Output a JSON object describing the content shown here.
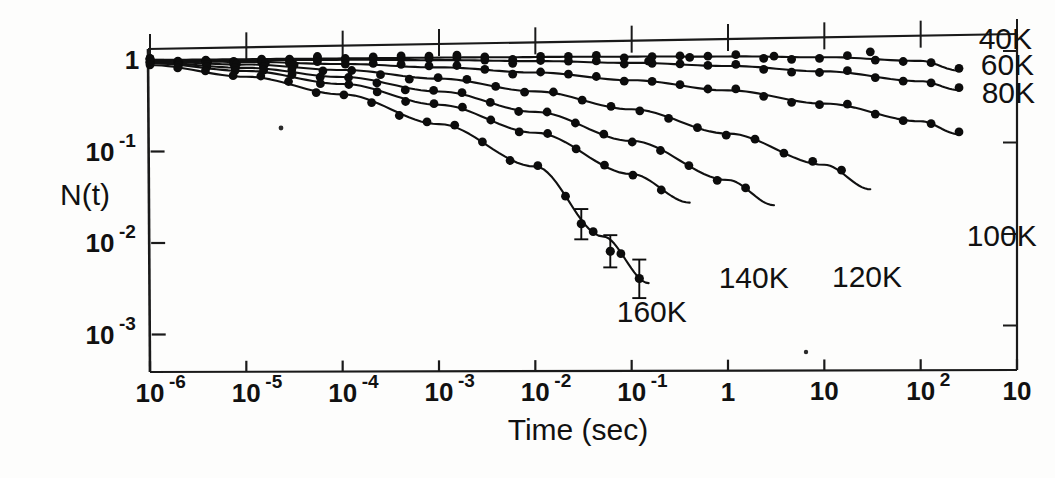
{
  "figure": {
    "background_color": "#fdfdfc",
    "ink_color": "#111111",
    "xlabel": "Time (sec)",
    "ylabel": "N(t)"
  },
  "chart_data": {
    "type": "line",
    "title": "",
    "subtitle": "",
    "xlabel": "Time (sec)",
    "ylabel": "N(t)",
    "xscale": "log",
    "yscale": "log",
    "xlim": [
      1e-06,
      1000
    ],
    "ylim": [
      0.001,
      2
    ],
    "grid": false,
    "legend_position": "inline-right-of-curves",
    "x_tick_labels": [
      "10-6",
      "10-5",
      "10-4",
      "10-3",
      "10-2",
      "10-1",
      "1",
      "10",
      "102",
      "10"
    ],
    "x_tick_mantissas": [
      "10",
      "10",
      "10",
      "10",
      "10",
      "10",
      "1",
      "10",
      "10",
      "10"
    ],
    "x_tick_exponents": [
      "-6",
      "-5",
      "-4",
      "-3",
      "-2",
      "-1",
      "",
      "",
      "2",
      ""
    ],
    "x_tick_values": [
      1e-06,
      1e-05,
      0.0001,
      0.001,
      0.01,
      0.1,
      1,
      10,
      100,
      1000
    ],
    "x_last_tick_clipped": true,
    "y_tick_labels": [
      "1",
      "10-1",
      "10-2",
      "10-3"
    ],
    "y_tick_mantissas": [
      "1",
      "10",
      "10",
      "10"
    ],
    "y_tick_exponents": [
      "",
      "-1",
      "-2",
      "-3"
    ],
    "y_tick_values": [
      1,
      0.1,
      0.01,
      0.001
    ],
    "series": [
      {
        "name": "40K",
        "label": "40K",
        "label_x": 400,
        "label_y": 1.05,
        "x": [
          1e-06,
          1e-05,
          0.0001,
          0.001,
          0.01,
          0.1,
          1,
          10,
          100,
          250
        ],
        "values": [
          1.0,
          0.995,
          0.99,
          0.985,
          0.975,
          0.96,
          0.94,
          0.9,
          0.8,
          0.62
        ]
      },
      {
        "name": "60K",
        "label": "60K",
        "label_x": 420,
        "label_y": 0.55,
        "x": [
          1e-06,
          1e-05,
          0.0001,
          0.001,
          0.01,
          0.1,
          1,
          10,
          100,
          250
        ],
        "values": [
          0.99,
          0.975,
          0.955,
          0.925,
          0.88,
          0.82,
          0.74,
          0.63,
          0.48,
          0.38
        ]
      },
      {
        "name": "80K",
        "label": "80K",
        "label_x": 430,
        "label_y": 0.27,
        "x": [
          1e-06,
          1e-05,
          0.0001,
          0.001,
          0.01,
          0.1,
          1,
          10,
          100,
          250
        ],
        "values": [
          0.975,
          0.93,
          0.86,
          0.77,
          0.66,
          0.53,
          0.4,
          0.28,
          0.175,
          0.125
        ]
      },
      {
        "name": "100K",
        "label": "100K",
        "label_x": 300,
        "label_y": 0.0075,
        "x": [
          1e-06,
          1e-05,
          0.0001,
          0.001,
          0.01,
          0.1,
          1,
          10,
          30
        ],
        "values": [
          0.96,
          0.87,
          0.74,
          0.58,
          0.41,
          0.255,
          0.135,
          0.06,
          0.032
        ]
      },
      {
        "name": "120K",
        "label": "120K",
        "label_x": 12,
        "label_y": 0.0028,
        "x": [
          1e-06,
          1e-05,
          0.0001,
          0.001,
          0.01,
          0.1,
          1,
          3
        ],
        "values": [
          0.94,
          0.8,
          0.62,
          0.42,
          0.245,
          0.115,
          0.042,
          0.022
        ]
      },
      {
        "name": "140K",
        "label": "140K",
        "label_x": 0.8,
        "label_y": 0.0028,
        "x": [
          1e-06,
          1e-05,
          0.0001,
          0.001,
          0.01,
          0.1,
          0.4
        ],
        "values": [
          0.92,
          0.74,
          0.52,
          0.3,
          0.145,
          0.05,
          0.024
        ]
      },
      {
        "name": "160K",
        "label": "160K",
        "label_x": 0.07,
        "label_y": 0.0012,
        "x": [
          1e-06,
          1e-05,
          0.0001,
          0.001,
          0.01,
          0.05,
          0.15
        ],
        "values": [
          0.88,
          0.64,
          0.4,
          0.185,
          0.062,
          0.0105,
          0.0032
        ]
      }
    ],
    "error_bars": [
      {
        "series": "160K",
        "x": 0.03,
        "y": 0.0145,
        "lower": 0.0098,
        "upper": 0.021
      },
      {
        "series": "160K",
        "x": 0.06,
        "y": 0.0072,
        "lower": 0.0048,
        "upper": 0.0108
      },
      {
        "series": "160K",
        "x": 0.12,
        "y": 0.0036,
        "lower": 0.0022,
        "upper": 0.0058
      }
    ]
  }
}
